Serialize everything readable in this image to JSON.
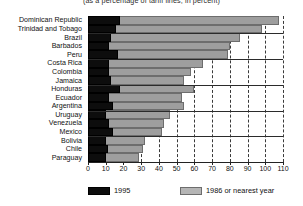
{
  "chart_data": {
    "type": "bar",
    "orientation": "horizontal",
    "title": "(as a percentage of tariff lines, in percent)",
    "xlabel": "",
    "ylabel": "",
    "xlim": [
      0,
      110
    ],
    "xticks": [
      0,
      10,
      20,
      30,
      40,
      50,
      60,
      70,
      80,
      90,
      100,
      110
    ],
    "grid": true,
    "grid_axis": "x",
    "legend_position": "bottom",
    "categories": [
      "Dominican Republic",
      "Trinidad and Tobago",
      "Brazil",
      "Barbados",
      "Peru",
      "Costa Rica",
      "Colombia",
      "Jamaica",
      "Honduras",
      "Ecuador",
      "Argentina",
      "Uruguay",
      "Venezuela",
      "Mexico",
      "Bolivia",
      "Chile",
      "Paraguay"
    ],
    "series": [
      {
        "name": "1995",
        "color": "#0d0d0d",
        "values": [
          18,
          16,
          13,
          12,
          17,
          12,
          12,
          13,
          18,
          12,
          14,
          10,
          12,
          14,
          10,
          11,
          10
        ]
      },
      {
        "name": "1986 or nearest year",
        "color": "#9e9e9e",
        "values": [
          108,
          98,
          86,
          80,
          79,
          65,
          58,
          54,
          60,
          53,
          54,
          46,
          43,
          42,
          32,
          31,
          29
        ]
      }
    ]
  },
  "legend": {
    "items": [
      {
        "label": "1995",
        "swatch": "black-swatch"
      },
      {
        "label": "1986 or nearest year",
        "swatch": "gray-swatch"
      }
    ]
  }
}
